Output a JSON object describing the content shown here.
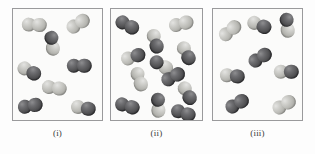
{
  "figure": {
    "background_color": "#fdfdfd",
    "panel_border_color": "#9a9a9c",
    "panel_fill_color": "#fbfbfa",
    "atom_colors": {
      "dark": "#4a4a4d",
      "light": "#c2c2be"
    },
    "atom_radius_px": 7.2,
    "bond_offset_px": 5.4
  },
  "panels": [
    {
      "id": "panel-i",
      "caption": "(i)",
      "x": 12,
      "y": 8,
      "width": 91,
      "height": 113,
      "caption_x": 12,
      "caption_y": 128,
      "caption_width": 91,
      "molecule_count": 8,
      "molecules": [
        {
          "cx": 21,
          "cy": 16,
          "angle": 2,
          "a": "light",
          "b": "light"
        },
        {
          "cx": 65,
          "cy": 15,
          "angle": -32,
          "a": "light",
          "b": "light"
        },
        {
          "cx": 39,
          "cy": 34,
          "angle": 82,
          "a": "dark",
          "b": "light"
        },
        {
          "cx": 16,
          "cy": 62,
          "angle": 28,
          "a": "light",
          "b": "dark"
        },
        {
          "cx": 66,
          "cy": 57,
          "angle": 0,
          "a": "dark",
          "b": "dark"
        },
        {
          "cx": 41,
          "cy": 79,
          "angle": 8,
          "a": "light",
          "b": "light"
        },
        {
          "cx": 17,
          "cy": 97,
          "angle": -10,
          "a": "dark",
          "b": "dark"
        },
        {
          "cx": 70,
          "cy": 99,
          "angle": 10,
          "a": "light",
          "b": "dark"
        }
      ]
    },
    {
      "id": "panel-ii",
      "caption": "(ii)",
      "x": 110,
      "y": 8,
      "width": 93,
      "height": 113,
      "caption_x": 110,
      "caption_y": 128,
      "caption_width": 93,
      "molecule_count": 12,
      "molecules": [
        {
          "cx": 16,
          "cy": 16,
          "angle": 28,
          "a": "dark",
          "b": "dark"
        },
        {
          "cx": 70,
          "cy": 15,
          "angle": -14,
          "a": "light",
          "b": "light"
        },
        {
          "cx": 44,
          "cy": 32,
          "angle": 74,
          "a": "light",
          "b": "dark"
        },
        {
          "cx": 22,
          "cy": 48,
          "angle": -18,
          "a": "light",
          "b": "dark"
        },
        {
          "cx": 75,
          "cy": 44,
          "angle": 64,
          "a": "light",
          "b": "dark"
        },
        {
          "cx": 50,
          "cy": 56,
          "angle": 30,
          "a": "dark",
          "b": "light"
        },
        {
          "cx": 28,
          "cy": 70,
          "angle": 72,
          "a": "light",
          "b": "light"
        },
        {
          "cx": 62,
          "cy": 68,
          "angle": -28,
          "a": "dark",
          "b": "dark"
        },
        {
          "cx": 76,
          "cy": 84,
          "angle": 62,
          "a": "light",
          "b": "dark"
        },
        {
          "cx": 16,
          "cy": 97,
          "angle": 16,
          "a": "dark",
          "b": "dark"
        },
        {
          "cx": 47,
          "cy": 96,
          "angle": 88,
          "a": "dark",
          "b": "light"
        },
        {
          "cx": 72,
          "cy": 104,
          "angle": 18,
          "a": "dark",
          "b": "dark"
        }
      ]
    },
    {
      "id": "panel-iii",
      "caption": "(iii)",
      "x": 212,
      "y": 8,
      "width": 91,
      "height": 113,
      "caption_x": 212,
      "caption_y": 128,
      "caption_width": 91,
      "molecule_count": 8,
      "molecules": [
        {
          "cx": 17,
          "cy": 22,
          "angle": -40,
          "a": "light",
          "b": "light"
        },
        {
          "cx": 46,
          "cy": 16,
          "angle": 22,
          "a": "light",
          "b": "dark"
        },
        {
          "cx": 74,
          "cy": 16,
          "angle": 84,
          "a": "dark",
          "b": "light"
        },
        {
          "cx": 47,
          "cy": 49,
          "angle": -32,
          "a": "dark",
          "b": "dark"
        },
        {
          "cx": 19,
          "cy": 67,
          "angle": 6,
          "a": "light",
          "b": "dark"
        },
        {
          "cx": 73,
          "cy": 63,
          "angle": 0,
          "a": "light",
          "b": "dark"
        },
        {
          "cx": 24,
          "cy": 95,
          "angle": -30,
          "a": "dark",
          "b": "dark"
        },
        {
          "cx": 71,
          "cy": 96,
          "angle": -30,
          "a": "light",
          "b": "light"
        }
      ]
    }
  ]
}
